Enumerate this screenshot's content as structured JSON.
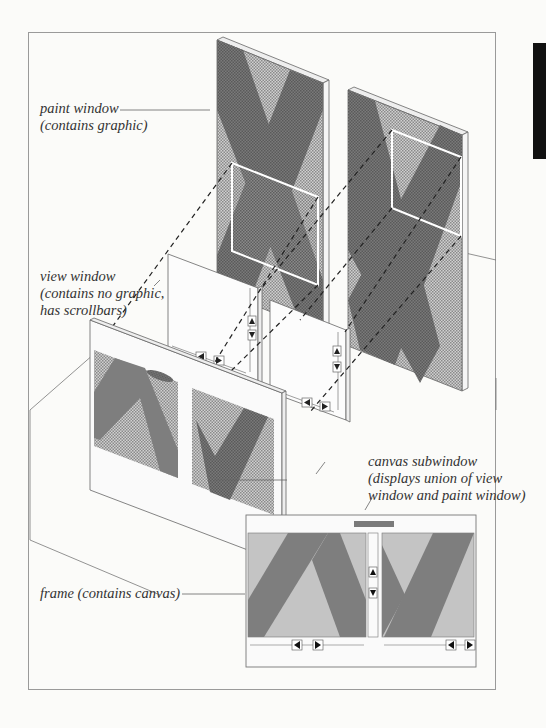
{
  "figure": {
    "labels": {
      "paint_window": {
        "line1": "paint window",
        "line2": "(contains graphic)"
      },
      "view_window": {
        "line1": "view window",
        "line2": "(contains no graphic,",
        "line3": "has scrollbars)"
      },
      "canvas_subwindow": {
        "line1": "canvas subwindow",
        "line2": "(displays union of view",
        "line3": "window and paint window)"
      },
      "frame": {
        "line1": "frame (contains canvas)"
      }
    },
    "components": [
      "paint window",
      "view window",
      "canvas subwindow",
      "frame"
    ],
    "colors": {
      "border": "#9a9a9a",
      "light_fill": "#c4c4c4",
      "dark_fill": "#7e7e7e",
      "highlight": "#ffffff",
      "side_tab": "#111111"
    },
    "scrollbar_icons": [
      "up-arrow-icon",
      "down-arrow-icon",
      "left-arrow-icon",
      "right-arrow-icon"
    ]
  }
}
